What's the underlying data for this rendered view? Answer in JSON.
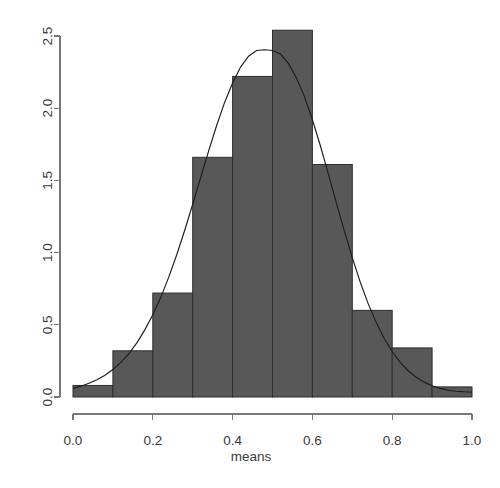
{
  "chart_data": {
    "type": "bar",
    "title": "",
    "subtitle": "",
    "xlabel": "means",
    "ylabel": "",
    "xlim": [
      0.0,
      1.0
    ],
    "ylim": [
      0.0,
      2.5
    ],
    "grid": false,
    "legend": null,
    "bin_width": 0.1,
    "bin_edges": [
      0.0,
      0.1,
      0.2,
      0.3,
      0.4,
      0.5,
      0.6,
      0.7,
      0.8,
      0.9,
      1.0
    ],
    "categories": [
      "0.0-0.1",
      "0.1-0.2",
      "0.2-0.3",
      "0.3-0.4",
      "0.4-0.5",
      "0.5-0.6",
      "0.6-0.7",
      "0.7-0.8",
      "0.8-0.9",
      "0.9-1.0"
    ],
    "values": [
      0.08,
      0.32,
      0.72,
      1.66,
      2.22,
      2.54,
      1.61,
      0.6,
      0.34,
      0.07
    ],
    "xticks": [
      0.0,
      0.2,
      0.4,
      0.6,
      0.8,
      1.0
    ],
    "xtick_labels": [
      "0.0",
      "0.2",
      "0.4",
      "0.6",
      "0.8",
      "1.0"
    ],
    "yticks": [
      0.0,
      0.5,
      1.0,
      1.5,
      2.0,
      2.5
    ],
    "ytick_labels": [
      "0.0",
      "0.5",
      "1.0",
      "1.5",
      "2.0",
      "2.5"
    ],
    "overlay": {
      "name": "density-curve",
      "type": "line",
      "mean": 0.5,
      "sd": 0.166,
      "peak": 2.4,
      "x": [
        0.0,
        0.02,
        0.04,
        0.06,
        0.08,
        0.1,
        0.12,
        0.14,
        0.16,
        0.18,
        0.2,
        0.22,
        0.24,
        0.26,
        0.28,
        0.3,
        0.32,
        0.34,
        0.36,
        0.38,
        0.4,
        0.42,
        0.44,
        0.46,
        0.48,
        0.5,
        0.52,
        0.54,
        0.56,
        0.58,
        0.6,
        0.62,
        0.64,
        0.66,
        0.68,
        0.7,
        0.72,
        0.74,
        0.76,
        0.78,
        0.8,
        0.82,
        0.84,
        0.86,
        0.88,
        0.9,
        0.92,
        0.94,
        0.96,
        0.98,
        1.0
      ],
      "y": [
        0.06,
        0.075,
        0.095,
        0.12,
        0.15,
        0.19,
        0.24,
        0.3,
        0.375,
        0.465,
        0.57,
        0.69,
        0.83,
        0.985,
        1.155,
        1.335,
        1.52,
        1.705,
        1.88,
        2.04,
        2.175,
        2.285,
        2.36,
        2.4,
        2.405,
        2.4,
        2.375,
        2.31,
        2.21,
        2.08,
        1.92,
        1.74,
        1.545,
        1.345,
        1.15,
        0.965,
        0.795,
        0.645,
        0.515,
        0.405,
        0.315,
        0.24,
        0.182,
        0.137,
        0.103,
        0.078,
        0.06,
        0.048,
        0.04,
        0.036,
        0.034
      ]
    },
    "colors": {
      "bar_fill": "#585858",
      "bar_border": "#2f2f2f",
      "curve": "#1d1d1d",
      "axis": "#777777",
      "text": "#3a3a3a",
      "background": "#ffffff"
    }
  }
}
